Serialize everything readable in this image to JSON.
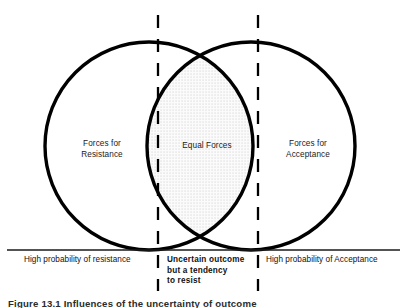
{
  "figure": {
    "type": "venn-two-circle-overlap",
    "regions": {
      "left": {
        "line1": "Forces for",
        "line2": "Resistance"
      },
      "center": {
        "line1": "Equal Forces"
      },
      "right": {
        "line1": "Forces for",
        "line2": "Acceptance"
      }
    },
    "axis": {
      "left_label": "High probability of resistance",
      "center_label_line1": "Uncertain outcome",
      "center_label_line2": "but a tendency",
      "center_label_line3": "to resist",
      "right_label": "High probability of Acceptance"
    },
    "caption": "Figure 13.1   Influences of the uncertainty of outcome",
    "colors": {
      "stroke": "#000000",
      "overlap_fill": "#e8e8e8",
      "baseline": "#1a1a1a",
      "text": "#111111"
    },
    "geometry": {
      "left_circle": {
        "cx": 149,
        "cy": 146,
        "r": 104
      },
      "right_circle": {
        "cx": 251,
        "cy": 146,
        "r": 104
      },
      "baseline_y": 250,
      "baseline_x1": 7,
      "baseline_x2": 400,
      "dashed_line_left_x": 158,
      "dashed_line_right_x": 258
    }
  }
}
